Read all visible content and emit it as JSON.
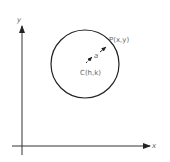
{
  "diagram": {
    "axes": {
      "x_label": "x",
      "y_label": "y"
    },
    "circle": {
      "center_label": "C(h,k)",
      "point_label": "P(x,y)",
      "radius_label": "a"
    },
    "colors": {
      "stroke": "#222222",
      "text": "#666666",
      "background": "#ffffff"
    }
  }
}
